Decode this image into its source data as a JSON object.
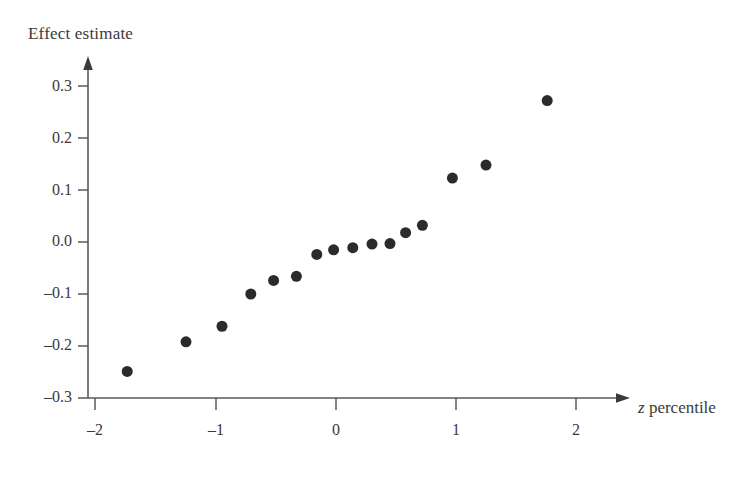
{
  "chart_data": {
    "type": "scatter",
    "title": "",
    "xlabel": "z percentile",
    "xlabel_variable": "z",
    "xlabel_rest": " percentile",
    "ylabel": "Effect estimate",
    "xlim": [
      -2.25,
      2.3
    ],
    "ylim": [
      -0.3,
      0.34
    ],
    "xticks": [
      -2,
      -1,
      0,
      1,
      2
    ],
    "xticklabels": [
      "–2",
      "–1",
      "0",
      "1",
      "2"
    ],
    "yticks": [
      -0.3,
      -0.2,
      -0.1,
      0.0,
      0.1,
      0.2,
      0.3
    ],
    "yticklabels": [
      "–0.3",
      "–0.2",
      "–0.1",
      "0.0",
      "0.1",
      "0.2",
      "0.3"
    ],
    "grid": false,
    "legend": null,
    "marker": "filled-circle",
    "marker_color": "#2b2b2b",
    "marker_size_px": 11,
    "axis_color": "#5a5a5a",
    "n_points": 16,
    "x": [
      -1.74,
      -1.25,
      -0.95,
      -0.71,
      -0.52,
      -0.33,
      -0.16,
      0.0,
      0.16,
      0.33,
      0.52,
      0.71,
      0.95,
      1.25,
      1.75
    ],
    "series": [
      {
        "name": "Effect estimate",
        "points": [
          {
            "z": -1.74,
            "effect": -0.249
          },
          {
            "z": -1.25,
            "effect": -0.192
          },
          {
            "z": -0.95,
            "effect": -0.162
          },
          {
            "z": -0.71,
            "effect": -0.1
          },
          {
            "z": -0.52,
            "effect": -0.074
          },
          {
            "z": -0.33,
            "effect": -0.066
          },
          {
            "z": -0.16,
            "effect": -0.024
          },
          {
            "z": -0.02,
            "effect": -0.015
          },
          {
            "z": 0.14,
            "effect": -0.011
          },
          {
            "z": 0.3,
            "effect": -0.004
          },
          {
            "z": 0.45,
            "effect": -0.003
          },
          {
            "z": 0.58,
            "effect": 0.018
          },
          {
            "z": 0.72,
            "effect": 0.032
          },
          {
            "z": 0.97,
            "effect": 0.123
          },
          {
            "z": 1.25,
            "effect": 0.148
          },
          {
            "z": 1.76,
            "effect": 0.272
          }
        ]
      }
    ]
  },
  "axes": {
    "y_axis_label": "Effect estimate",
    "x_axis_label_variable": "z",
    "x_axis_label_text": "percentile"
  }
}
